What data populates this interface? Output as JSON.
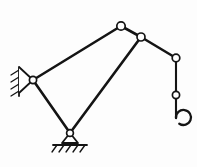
{
  "figure": {
    "background_color": "#fdfdfd",
    "line_color": "#141414",
    "joint_fill_color": "#ffffff",
    "width": 197,
    "height": 167
  },
  "joints": [
    {
      "id": "wall-pivot",
      "name": "wall-pivot-joint",
      "x": 33,
      "y": 80,
      "r": 3.6,
      "type": "fixed-pin"
    },
    {
      "id": "boom-apex",
      "name": "boom-apex-joint",
      "x": 121,
      "y": 26,
      "r": 4.2,
      "type": "pin"
    },
    {
      "id": "boom-head",
      "name": "boom-head-joint",
      "x": 141,
      "y": 37,
      "r": 4.0,
      "type": "pin"
    },
    {
      "id": "sheave",
      "name": "sheave-joint",
      "x": 176,
      "y": 58,
      "r": 3.8,
      "type": "pin"
    },
    {
      "id": "cable-link",
      "name": "cable-link-joint",
      "x": 176,
      "y": 95,
      "r": 3.6,
      "type": "pin"
    },
    {
      "id": "ground-pivot",
      "name": "ground-pivot-joint",
      "x": 70,
      "y": 133,
      "r": 3.4,
      "type": "ground-pin"
    }
  ],
  "members": [
    {
      "name": "upper-boom-member",
      "from": "wall-pivot",
      "to": "boom-apex"
    },
    {
      "name": "apex-head-member",
      "from": "boom-apex",
      "to": "boom-head"
    },
    {
      "name": "head-sheave-member",
      "from": "boom-head",
      "to": "sheave"
    },
    {
      "name": "diagonal-tie-member",
      "from": "boom-head",
      "to": "ground-pivot"
    },
    {
      "name": "column-member",
      "from": "wall-pivot",
      "to": "ground-pivot"
    },
    {
      "name": "upper-cable-member",
      "from": "sheave",
      "to": "cable-link"
    },
    {
      "name": "lower-cable-member",
      "from": "cable-link",
      "to": "hook-top"
    }
  ],
  "supports": {
    "wall_support": {
      "name": "wall-fixed-support",
      "type": "hatched-wall-pin",
      "pivot_x": 33,
      "pivot_y": 80,
      "wall_x": 18,
      "wall_top_y": 66,
      "wall_bottom_y": 96,
      "hatch_count": 4
    },
    "ground_support": {
      "name": "ground-pin-support",
      "type": "triangle-ground-pin",
      "pivot_x": 70,
      "pivot_y": 133,
      "triangle_half_width": 8,
      "triangle_height": 9,
      "ground_y": 145,
      "ground_half_width": 17,
      "hatch_count": 5
    }
  },
  "hook": {
    "name": "lifting-hook",
    "top_x": 176,
    "top_y": 118,
    "center_x": 174,
    "center_y": 129,
    "radius": 7.5,
    "open_direction": "up-right"
  },
  "labels": {
    "visible_text": []
  }
}
